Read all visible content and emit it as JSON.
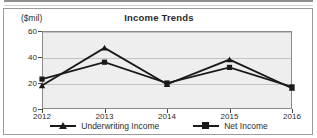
{
  "chart_data": {
    "type": "line",
    "title": "Income Trends",
    "units_label": "($mil)",
    "xlabel": "",
    "ylabel": "",
    "categories": [
      "2012",
      "2013",
      "2014",
      "2015",
      "2016"
    ],
    "series": [
      {
        "name": "Underwriting Income",
        "marker": "triangle",
        "color": "#1a1a1a",
        "values": [
          18,
          47,
          19,
          38,
          16
        ]
      },
      {
        "name": "Net Income",
        "marker": "square",
        "color": "#1a1a1a",
        "values": [
          23,
          36,
          20,
          32,
          17
        ]
      }
    ],
    "ylim": [
      0,
      60
    ],
    "yticks": [
      0,
      20,
      40,
      60
    ],
    "ytick_labels": [
      "0",
      "20",
      "40",
      "60"
    ],
    "grid": true,
    "legend_position": "bottom",
    "plot_background": "#eeeeee",
    "frame_color": "#9a9a9a"
  },
  "legend": {
    "entries": [
      {
        "label": "Underwriting Income"
      },
      {
        "label": "Net Income"
      }
    ]
  }
}
